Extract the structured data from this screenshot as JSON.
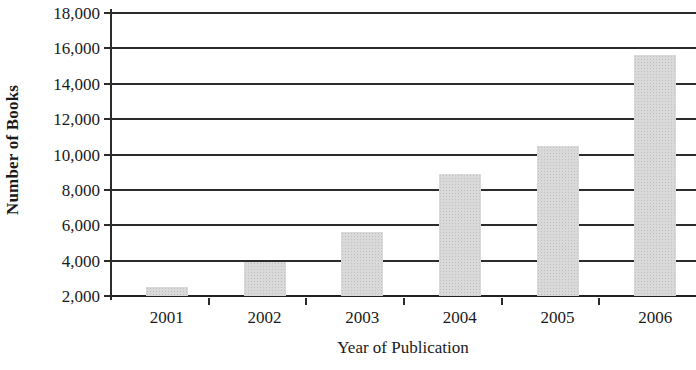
{
  "chart_data": {
    "type": "bar",
    "title": "",
    "xlabel": "Year of Publication",
    "ylabel": "Number of Books",
    "categories": [
      "2001",
      "2002",
      "2003",
      "2004",
      "2005",
      "2006"
    ],
    "values": [
      2500,
      3950,
      5600,
      8900,
      10500,
      15600
    ],
    "series": [
      {
        "name": "Number of Books",
        "values": [
          2500,
          3950,
          5600,
          8900,
          10500,
          15600
        ]
      }
    ],
    "ylim": [
      2000,
      18000
    ],
    "ytick_labels": [
      "18,000",
      "16,000",
      "14,000",
      "12,000",
      "10,000",
      "8,000",
      "6,000",
      "4,000",
      "2,000"
    ],
    "ytick_values": [
      18000,
      16000,
      14000,
      12000,
      10000,
      8000,
      6000,
      4000,
      2000
    ],
    "ytick_step": 2000,
    "grid": "horizontal",
    "legend": "none",
    "bar_color": "#d9d9d9",
    "axis_color": "#2b2b2b",
    "text_color": "#1a1a1a"
  }
}
